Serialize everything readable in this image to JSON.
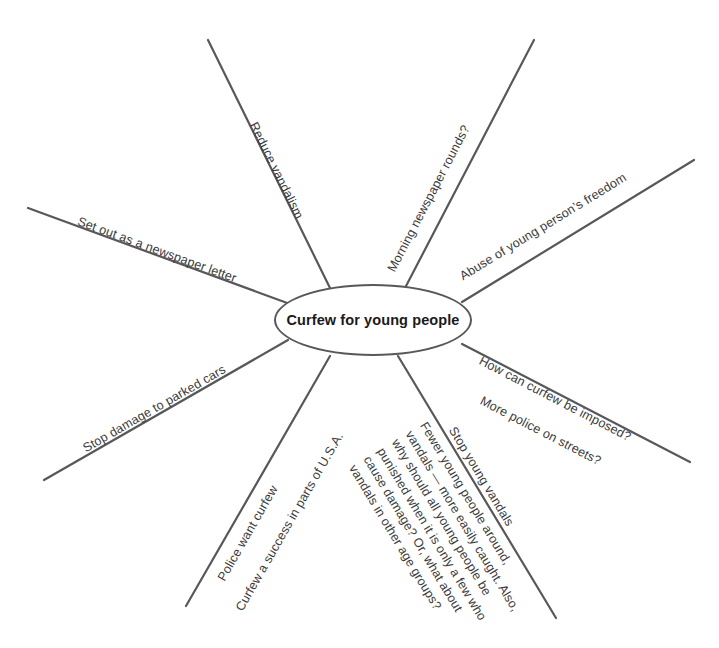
{
  "diagram": {
    "type": "mind-map",
    "center": {
      "label": "Curfew for young people"
    },
    "branches": [
      {
        "id": "reduce-vandalism",
        "label": "Reduce vandalism",
        "direction": "up-left"
      },
      {
        "id": "morning-newspaper-rounds",
        "label": "Morning newspaper rounds?",
        "direction": "up-right"
      },
      {
        "id": "set-out-as-newspaper-letter",
        "label": "Set out as a newspaper letter",
        "direction": "left-upper"
      },
      {
        "id": "abuse-of-young-persons-freedom",
        "label": "Abuse of young person’s freedom",
        "direction": "right-upper"
      },
      {
        "id": "stop-damage-to-parked-cars",
        "label": "Stop damage to parked cars",
        "direction": "left-lower"
      },
      {
        "id": "how-can-curfew-be-imposed",
        "label": "How can curfew be imposed?",
        "direction": "right-lower",
        "secondary": "More police on streets?"
      },
      {
        "id": "police-want-curfew",
        "label": "Police want curfew",
        "direction": "down-left",
        "secondary": "Curfew a success in parts of U.S.A."
      },
      {
        "id": "stop-young-vandals",
        "label": "Stop young vandals",
        "direction": "down-right"
      }
    ],
    "paragraph": {
      "lines": [
        "Fewer young people around,",
        "vandals — more easily caught. Also,",
        "why should all young people be",
        "punished when it is only a few who",
        "cause damage? Or, what about",
        "vandals in other age groups?"
      ]
    },
    "colors": {
      "line": "#58585a",
      "text": "#3b3b3d",
      "center_text": "#1a1a1a",
      "background": "#ffffff"
    }
  }
}
